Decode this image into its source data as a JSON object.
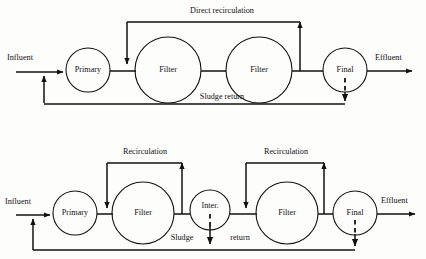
{
  "figure": {
    "type": "process-flow-diagram",
    "background_color": "#fdfdfb",
    "line_color": "#111111"
  },
  "diagrams": [
    {
      "id": "top-scheme",
      "name": "two-stage-filter-direct-recirculation",
      "inlet_label": "Influent",
      "outlet_label": "Effluent",
      "units": [
        {
          "id": "primary",
          "label": "Primary",
          "cx": 88,
          "cy": 70,
          "r": 22
        },
        {
          "id": "filter1",
          "label": "Filter",
          "cx": 168,
          "cy": 70,
          "r": 33
        },
        {
          "id": "filter2",
          "label": "Filter",
          "cx": 259,
          "cy": 70,
          "r": 33
        },
        {
          "id": "final",
          "label": "Final",
          "cx": 345,
          "cy": 70,
          "r": 22
        }
      ],
      "streams": [
        {
          "id": "direct-recirculation",
          "label": "Direct recirculation"
        },
        {
          "id": "sludge-return",
          "label": "Sludge return"
        }
      ]
    },
    {
      "id": "bottom-scheme",
      "name": "two-stage-filter-separate-recirculation",
      "inlet_label": "Influent",
      "outlet_label": "Effluent",
      "units": [
        {
          "id": "primary",
          "label": "Primary",
          "cx": 75,
          "cy": 213,
          "r": 22
        },
        {
          "id": "filter1",
          "label": "Filter",
          "cx": 143,
          "cy": 213,
          "r": 31
        },
        {
          "id": "intermediate",
          "label": "Inter.",
          "cx": 210,
          "cy": 210,
          "r": 20
        },
        {
          "id": "filter2",
          "label": "Filter",
          "cx": 287,
          "cy": 213,
          "r": 31
        },
        {
          "id": "final",
          "label": "Final",
          "cx": 355,
          "cy": 213,
          "r": 22
        }
      ],
      "streams": [
        {
          "id": "recirculation-1",
          "label": "Recirculation"
        },
        {
          "id": "recirculation-2",
          "label": "Recirculation"
        },
        {
          "id": "sludge-return-left",
          "label": "Sludge"
        },
        {
          "id": "sludge-return-right",
          "label": "return"
        }
      ]
    }
  ]
}
